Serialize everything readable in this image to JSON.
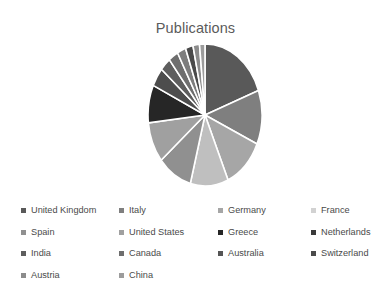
{
  "chart_data": {
    "type": "pie",
    "title": "Publications",
    "xlabel": "",
    "ylabel": "",
    "legend_position": "bottom",
    "grid": false,
    "start_angle_deg": 0,
    "direction": "clockwise",
    "categories": [
      "United Kingdom",
      "Italy",
      "Germany",
      "France",
      "Spain",
      "United States",
      "Greece",
      "Netherlands",
      "India",
      "Canada",
      "Australia",
      "Switzerland",
      "Austria",
      "China"
    ],
    "values": [
      63,
      40,
      38,
      35,
      32,
      30,
      28,
      14,
      10,
      9,
      8,
      7,
      6,
      5
    ],
    "colors": [
      "#595959",
      "#7f7f7f",
      "#a6a6a6",
      "#bfbfbf",
      "#909090",
      "#a0a0a0",
      "#262626",
      "#4d4d4d",
      "#5e5e5e",
      "#6e6e6e",
      "#7d7d7d",
      "#4a4a4a",
      "#8c8c8c",
      "#9c9c9c"
    ],
    "slice_border_color": "#ffffff"
  },
  "legend": {
    "rows": [
      [
        {
          "label": "United Kingdom",
          "color": "#595959"
        },
        {
          "label": "Italy",
          "color": "#7f7f7f"
        },
        {
          "label": "Germany",
          "color": "#a6a6a6"
        },
        {
          "label": "France",
          "color": "#d2d2d2"
        }
      ],
      [
        {
          "label": "Spain",
          "color": "#909090"
        },
        {
          "label": "United States",
          "color": "#a0a0a0"
        },
        {
          "label": "Greece",
          "color": "#262626"
        },
        {
          "label": "Netherlands",
          "color": "#3a3a3a"
        }
      ],
      [
        {
          "label": "India",
          "color": "#5e5e5e"
        },
        {
          "label": "Canada",
          "color": "#6e6e6e"
        },
        {
          "label": "Australia",
          "color": "#555555"
        },
        {
          "label": "Switzerland",
          "color": "#4a4a4a"
        }
      ],
      [
        {
          "label": "Austria",
          "color": "#8c8c8c"
        },
        {
          "label": "China",
          "color": "#9c9c9c"
        }
      ]
    ]
  }
}
